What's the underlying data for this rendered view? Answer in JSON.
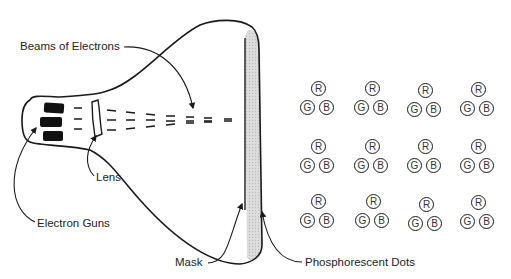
{
  "diagram": {
    "labels": {
      "beams": "Beams of Electrons",
      "lens": "Lens",
      "guns": "Electron Guns",
      "mask": "Mask",
      "phosphor": "Phosphorescent Dots"
    },
    "dot_letters": {
      "red": "R",
      "green": "G",
      "blue": "B"
    },
    "colors": {
      "ink": "#1a1a1a",
      "screen": "#d6d6d6",
      "background": "#ffffff"
    },
    "triad_grid": {
      "rows": 3,
      "cols": 4
    }
  }
}
